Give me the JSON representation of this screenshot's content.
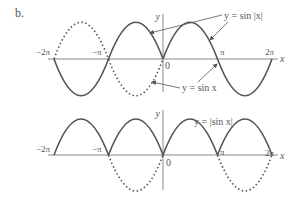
{
  "figure": {
    "part_label": "b.",
    "top_graph": {
      "y_axis_label": "y",
      "x_axis_label": "x",
      "origin_label": "0",
      "tick_labels": [
        "−2π",
        "−π",
        "π",
        "2π"
      ],
      "annotation_solid": "y = sin |x|",
      "annotation_dotted": "y = sin x"
    },
    "bottom_graph": {
      "y_axis_label": "y",
      "x_axis_label": "x",
      "origin_label": "0",
      "tick_labels": [
        "−2π",
        "−π",
        "π",
        "2π"
      ],
      "annotation_solid": "y = |sin x|"
    },
    "colors": {
      "curve": "#555555",
      "axis": "#8a8a8a",
      "text": "#555555"
    }
  }
}
